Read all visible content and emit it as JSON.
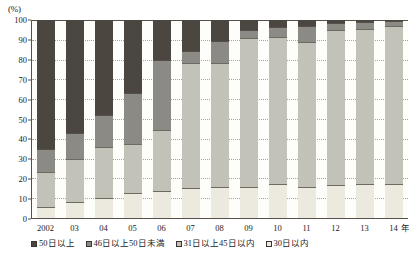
{
  "chart_data": {
    "type": "bar",
    "stacked": true,
    "normalized": true,
    "title": "",
    "xlabel": "年",
    "ylabel": "(%)",
    "ylim": [
      0,
      100
    ],
    "ytick_step": 10,
    "ytick_labels": [
      "0",
      "10",
      "20",
      "30",
      "40",
      "50",
      "60",
      "70",
      "80",
      "90",
      "100"
    ],
    "grid": true,
    "legend_position": "bottom",
    "categories": [
      "2002",
      "03",
      "04",
      "05",
      "06",
      "07",
      "08",
      "09",
      "10",
      "11",
      "12",
      "13",
      "14"
    ],
    "series": [
      {
        "name": "30日以内",
        "color": "#ece9de",
        "values": [
          5.5,
          8.0,
          10.0,
          12.5,
          13.5,
          15.0,
          15.5,
          15.5,
          17.0,
          15.5,
          16.5,
          17.0,
          17.0
        ]
      },
      {
        "name": "31日以上45日以内",
        "color": "#c3c2b8",
        "values": [
          17.5,
          22.0,
          26.0,
          25.0,
          31.0,
          63.5,
          63.0,
          75.5,
          74.5,
          73.5,
          78.5,
          78.5,
          80.0
        ]
      },
      {
        "name": "46日以上50日未満",
        "color": "#8b8a84",
        "values": [
          12.0,
          13.0,
          16.0,
          25.5,
          35.5,
          6.0,
          11.0,
          4.0,
          5.0,
          8.0,
          3.5,
          3.5,
          2.5
        ]
      },
      {
        "name": "50日以上",
        "color": "#4b463f",
        "values": [
          65.0,
          57.0,
          48.0,
          37.0,
          20.0,
          15.5,
          10.5,
          5.0,
          3.5,
          3.0,
          1.5,
          1.0,
          0.5
        ]
      }
    ],
    "legend": [
      {
        "label": "50日以上",
        "color": "#4b463f"
      },
      {
        "label": "46日以上50日未満",
        "color": "#8b8a84"
      },
      {
        "label": "31日以上45日以内",
        "color": "#c3c2b8"
      },
      {
        "label": "30日以内",
        "color": "#ece9de"
      }
    ]
  }
}
